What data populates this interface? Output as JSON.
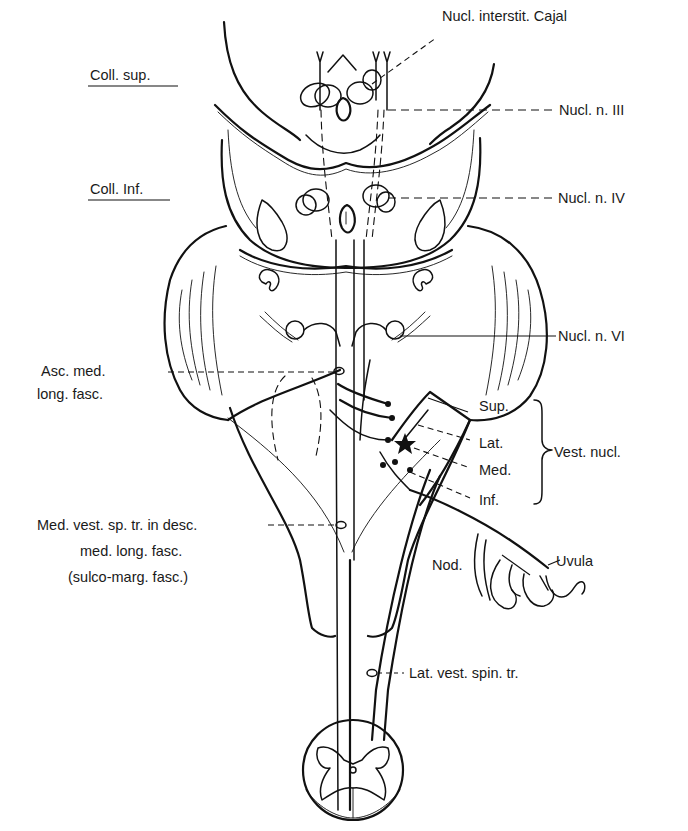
{
  "figure": {
    "ink_color": "#111111",
    "background": "#ffffff"
  },
  "left_labels": {
    "coll_sup": "Coll. sup.",
    "coll_inf": "Coll. Inf.",
    "asc_mlf_line1": "Asc. med.",
    "asc_mlf_line2": "long. fasc.",
    "med_vst_line1": "Med. vest. sp. tr. in desc.",
    "med_vst_line2": "med. long. fasc.",
    "med_vst_line3": "(sulco-marg. fasc.)"
  },
  "right_labels": {
    "cajal": "Nucl. interstit. Cajal",
    "n3": "Nucl. n. III",
    "n4": "Nucl. n. IV",
    "n6": "Nucl. n. VI",
    "vest_sup": "Sup.",
    "vest_lat": "Lat.",
    "vest_med": "Med.",
    "vest_inf": "Inf.",
    "vest_group": "Vest. nucl.",
    "nod": "Nod.",
    "uvula": "Uvula",
    "lat_vst": "Lat. vest. spin. tr."
  }
}
